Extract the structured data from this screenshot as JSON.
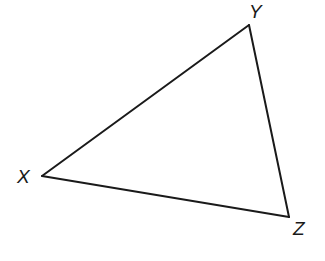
{
  "diagram": {
    "type": "triangle",
    "vertices": [
      {
        "name": "X",
        "x": 42,
        "y": 176
      },
      {
        "name": "Y",
        "x": 249,
        "y": 25
      },
      {
        "name": "Z",
        "x": 289,
        "y": 217
      }
    ],
    "edges": [
      {
        "name": "XY",
        "from": "X",
        "to": "Y"
      },
      {
        "name": "YZ",
        "from": "Y",
        "to": "Z"
      },
      {
        "name": "ZX",
        "from": "Z",
        "to": "X"
      }
    ],
    "labels": {
      "x": {
        "text": "X",
        "x": 17,
        "y": 183
      },
      "y": {
        "text": "Y",
        "x": 249,
        "y": 18
      },
      "z": {
        "text": "Z",
        "x": 293,
        "y": 235
      }
    },
    "colors": {
      "stroke": "#1a1a1a",
      "background": "#ffffff"
    }
  }
}
